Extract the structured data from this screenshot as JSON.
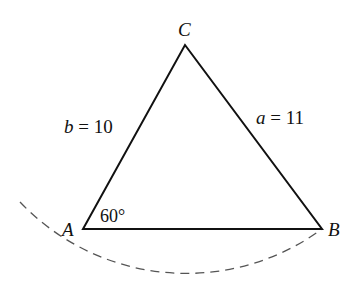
{
  "diagram": {
    "type": "triangle",
    "vertices": {
      "A": {
        "label": "A",
        "x": 83,
        "y": 229
      },
      "B": {
        "label": "B",
        "x": 322,
        "y": 229
      },
      "C": {
        "label": "C",
        "x": 185,
        "y": 45
      }
    },
    "sides": {
      "a": {
        "var": "a",
        "eq": " = ",
        "value": "11"
      },
      "b": {
        "var": "b",
        "eq": " = ",
        "value": "10"
      }
    },
    "angle_A": {
      "label": "60°"
    },
    "arc": {
      "style": "dashed",
      "center": "C",
      "radius_side": "a"
    },
    "colors": {
      "stroke": "#111111",
      "arc": "#555555",
      "background": "#ffffff"
    }
  }
}
